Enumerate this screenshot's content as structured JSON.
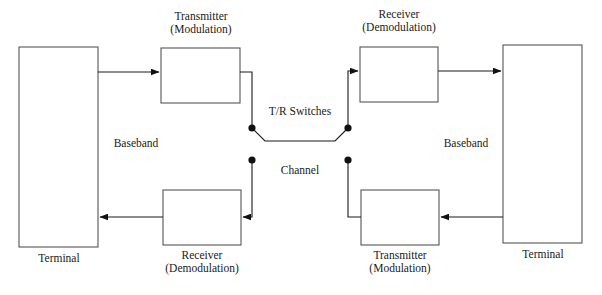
{
  "diagram": {
    "stroke_color": "#555555",
    "text_color": "#1a1a1a",
    "background_color": "#ffffff",
    "boxes": [
      {
        "id": "terminal-left",
        "label": "Terminal",
        "label_position": "below",
        "x": 19,
        "y": 47,
        "w": 79,
        "h": 200
      },
      {
        "id": "transmitter-top-left",
        "label_line1": "Transmitter",
        "label_line2": "(Modulation)",
        "label_position": "above",
        "x": 161,
        "y": 48,
        "w": 79,
        "h": 55
      },
      {
        "id": "receiver-top-right",
        "label_line1": "Receiver",
        "label_line2": "(Demodulation)",
        "label_position": "above",
        "x": 360,
        "y": 47,
        "w": 78,
        "h": 55
      },
      {
        "id": "terminal-right",
        "label": "Terminal",
        "label_position": "below",
        "x": 503,
        "y": 45,
        "w": 79,
        "h": 198
      },
      {
        "id": "receiver-bottom-left",
        "label_line1": "Receiver",
        "label_line2": "(Demodulation)",
        "label_position": "below",
        "x": 163,
        "y": 190,
        "w": 78,
        "h": 55
      },
      {
        "id": "transmitter-bottom-right",
        "label_line1": "Transmitter",
        "label_line2": "(Modulation)",
        "label_position": "below",
        "x": 361,
        "y": 190,
        "w": 78,
        "h": 55
      }
    ],
    "labels": {
      "terminal_left": "Terminal",
      "terminal_right": "Terminal",
      "transmitter_top_l1": "Transmitter",
      "transmitter_top_l2": "(Modulation)",
      "receiver_top_l1": "Receiver",
      "receiver_top_l2": "(Demodulation)",
      "receiver_bottom_l1": "Receiver",
      "receiver_bottom_l2": "(Demodulation)",
      "transmitter_bottom_l1": "Transmitter",
      "transmitter_bottom_l2": "(Modulation)",
      "baseband_left": "Baseband",
      "baseband_right": "Baseband",
      "tr_switches": "T/R Switches",
      "channel": "Channel"
    },
    "switch_nodes": [
      {
        "id": "tr-switch-upper-left",
        "cx": 252,
        "cy": 128
      },
      {
        "id": "tr-switch-upper-right",
        "cx": 348,
        "cy": 128
      },
      {
        "id": "tr-switch-lower-left",
        "cx": 252,
        "cy": 160
      },
      {
        "id": "tr-switch-lower-right",
        "cx": 348,
        "cy": 160
      }
    ],
    "signal_flow": [
      "Terminal (left) → Transmitter (Modulation) → T/R Switch → Channel",
      "Channel → T/R Switch → Receiver (Demodulation) → Terminal (right)",
      "Terminal (right) → Transmitter (Modulation) → T/R Switch → Channel",
      "Channel → T/R Switch → Receiver (Demodulation) → Terminal (left)"
    ]
  }
}
